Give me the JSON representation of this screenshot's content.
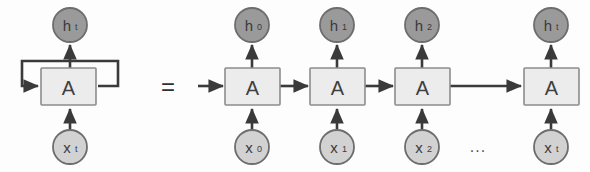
{
  "figure": {
    "background_color": "#fdfdfd",
    "equals_sign": "=",
    "ellipsis": "...",
    "colors": {
      "hidden_state_fill": "#9a9a9a",
      "hidden_state_stroke": "#6d6d6d",
      "input_fill": "#d2d2d2",
      "input_stroke": "#6d6d6d",
      "cell_fill": "#ececec",
      "cell_stroke": "#8c8c8c",
      "arrow_color": "#3a3a3a",
      "text_color": "#3a3a3a"
    }
  },
  "folded": {
    "cell": {
      "label": "A",
      "name": "rnn-cell"
    },
    "output": {
      "base": "h",
      "subscript": "t"
    },
    "input": {
      "base": "x",
      "subscript": "t"
    },
    "loop": {
      "name": "recurrent-self-loop"
    }
  },
  "unrolled": {
    "steps": [
      {
        "cell_label": "A",
        "output_base": "h",
        "output_sub": "0",
        "input_base": "x",
        "input_sub": "0"
      },
      {
        "cell_label": "A",
        "output_base": "h",
        "output_sub": "1",
        "input_base": "x",
        "input_sub": "1"
      },
      {
        "cell_label": "A",
        "output_base": "h",
        "output_sub": "2",
        "input_base": "x",
        "input_sub": "2"
      },
      {
        "cell_label": "A",
        "output_base": "h",
        "output_sub": "t",
        "input_base": "x",
        "input_sub": "t"
      }
    ]
  }
}
